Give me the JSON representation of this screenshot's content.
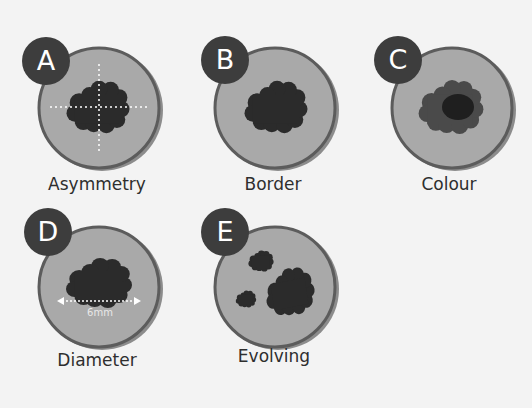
{
  "colors": {
    "background": "#f3f3f3",
    "badge": "#3d3d3d",
    "badge_text": "#ffffff",
    "circle_fill": "#a9a9a9",
    "circle_border": "#5c5c5c",
    "circle_shadow": "#8c8c8c",
    "lesion": "#2b2b2b",
    "lesion_light": "#4a4a4a",
    "guide_line": "#ffffff",
    "label_text": "#2e2e2e"
  },
  "panels": [
    {
      "letter": "A",
      "label": "Asymmetry",
      "feature": "asymmetry"
    },
    {
      "letter": "B",
      "label": "Border",
      "feature": "border"
    },
    {
      "letter": "C",
      "label": "Colour",
      "feature": "colour"
    },
    {
      "letter": "D",
      "label": "Diameter",
      "feature": "diameter",
      "measurement": "6mm"
    },
    {
      "letter": "E",
      "label": "Evolving",
      "feature": "evolving"
    }
  ]
}
